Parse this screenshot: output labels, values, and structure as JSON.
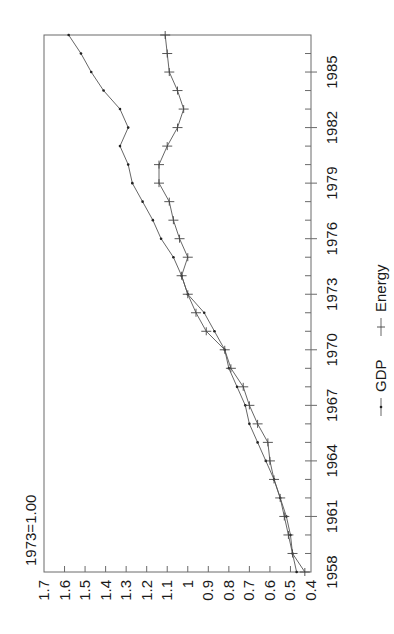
{
  "chart_data": {
    "type": "line",
    "orientation": "rotated 90 degrees counter-clockwise",
    "title": "",
    "annotation": "1973=1.00",
    "xlabel": "",
    "ylabel": "",
    "x": [
      1958,
      1959,
      1960,
      1961,
      1962,
      1963,
      1964,
      1965,
      1966,
      1967,
      1968,
      1969,
      1970,
      1971,
      1972,
      1973,
      1974,
      1975,
      1976,
      1977,
      1978,
      1979,
      1980,
      1981,
      1982,
      1983,
      1984,
      1985,
      1986,
      1987
    ],
    "x_ticks": [
      "1958",
      "1961",
      "1964",
      "1967",
      "1970",
      "1973",
      "1976",
      "1979",
      "1982",
      "1985"
    ],
    "xlim": [
      1958,
      1987
    ],
    "y_ticks": [
      "1.7",
      "1.6",
      "1.5",
      "1.4",
      "1.3",
      "1.2",
      "1.1",
      "1",
      "0.9",
      "0.8",
      "0.7",
      "0.6",
      "0.5",
      "0.4"
    ],
    "ylim": [
      0.4,
      1.7
    ],
    "grid": false,
    "legend_position": "right",
    "series": [
      {
        "name": "GDP",
        "marker": "dot",
        "values": [
          0.47,
          0.49,
          0.5,
          0.52,
          0.55,
          0.58,
          0.62,
          0.66,
          0.7,
          0.72,
          0.76,
          0.8,
          0.82,
          0.87,
          0.92,
          1.0,
          1.03,
          1.07,
          1.13,
          1.17,
          1.22,
          1.27,
          1.29,
          1.33,
          1.29,
          1.33,
          1.41,
          1.47,
          1.52,
          1.58
        ]
      },
      {
        "name": "Energy",
        "marker": "cross",
        "values": [
          0.43,
          0.49,
          0.51,
          0.53,
          0.55,
          0.58,
          0.6,
          0.61,
          0.66,
          0.7,
          0.73,
          0.79,
          0.82,
          0.91,
          0.96,
          1.0,
          1.03,
          1.0,
          1.04,
          1.07,
          1.09,
          1.14,
          1.14,
          1.1,
          1.05,
          1.02,
          1.05,
          1.09,
          1.1,
          1.11
        ]
      }
    ]
  },
  "legend": {
    "items": [
      {
        "label": "GDP"
      },
      {
        "label": "Energy"
      }
    ]
  }
}
